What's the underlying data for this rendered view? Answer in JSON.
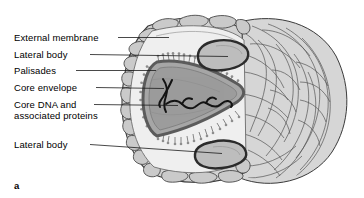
{
  "figure": {
    "panel_letter": "a",
    "background_color": "#ffffff"
  },
  "labels": [
    {
      "id": "external-membrane",
      "text": "External membrane",
      "x": 14,
      "y": 33,
      "leader": {
        "x1": 118,
        "y1": 37.5,
        "x2": 169,
        "y2": 37.5
      }
    },
    {
      "id": "lateral-body-top",
      "text": "Lateral body",
      "x": 14,
      "y": 50,
      "leader": {
        "x1": 90,
        "y1": 54.5,
        "x2": 206,
        "y2": 56.5
      }
    },
    {
      "id": "palisades",
      "text": "Palisades",
      "x": 14,
      "y": 66,
      "leader": {
        "x1": 76,
        "y1": 70.5,
        "x2": 156,
        "y2": 70.5
      }
    },
    {
      "id": "core-envelope",
      "text": "Core envelope",
      "x": 14,
      "y": 83,
      "leader": {
        "x1": 96,
        "y1": 87.5,
        "x2": 164,
        "y2": 90.0
      }
    },
    {
      "id": "core-dna-line-1",
      "text": "Core DNA and",
      "x": 14,
      "y": 100,
      "leader": {
        "x1": 94,
        "y1": 104.5,
        "x2": 172,
        "y2": 106.5
      }
    },
    {
      "id": "core-dna-line-2",
      "text": "associated proteins",
      "x": 14,
      "y": 111,
      "leader": null
    },
    {
      "id": "lateral-body-bottom",
      "text": "Lateral body",
      "x": 14,
      "y": 140,
      "leader": {
        "x1": 90,
        "y1": 144.5,
        "x2": 200,
        "y2": 146.5
      }
    }
  ],
  "structures": {
    "external_membrane": {
      "name": "external-membrane",
      "fill": "#d2d2d2",
      "stroke": "#3a3a3a"
    },
    "outer_bumps": {
      "name": "membrane-bumps",
      "fill": "#c9c9c9",
      "stroke": "#4a4a4a"
    },
    "inner_space": {
      "name": "inner-space",
      "fill": "#efefef",
      "stroke": "#6d6d6d"
    },
    "lateral_body": {
      "name": "lateral-body",
      "fill": "#bdbdbd",
      "stroke": "#2b2b2b"
    },
    "core_envelope": {
      "name": "core-envelope",
      "fill": "#a8a8a8",
      "stroke": "#5b5b5b"
    },
    "core_interior": {
      "name": "core-interior",
      "fill": "#9c9c9c",
      "stroke": "#6a6a6a"
    },
    "palisades": {
      "name": "palisades-spikes",
      "stroke": "#6b6b6b"
    },
    "core_dna": {
      "name": "core-dna-strand",
      "stroke": "#111111"
    },
    "fibrous_body": {
      "name": "fibrous-lateral-mass",
      "fill": "#d6d6d6",
      "stroke": "#3f3f3f"
    }
  }
}
